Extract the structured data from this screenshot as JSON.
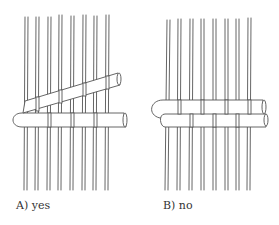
{
  "figure": {
    "panels": [
      {
        "id": "A",
        "caption": "A) yes",
        "spoke_count": 8
      },
      {
        "id": "B",
        "caption": "B) no",
        "spoke_count": 8
      }
    ],
    "colors": {
      "line": "#555555",
      "fill": "#ffffff",
      "text": "#333333"
    }
  }
}
